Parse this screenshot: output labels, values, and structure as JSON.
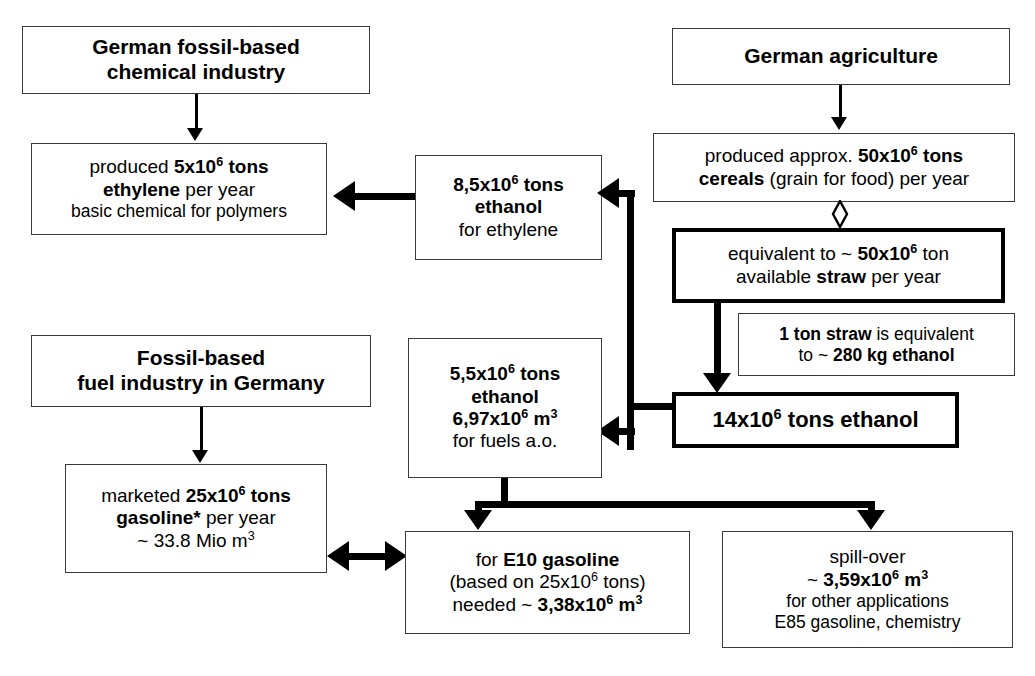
{
  "diagram": {
    "colors": {
      "line": "#000000",
      "box_border": "#3a3a3a",
      "background": "#ffffff"
    }
  },
  "boxes": {
    "chemical_industry": {
      "lines": [
        "German fossil-based",
        "chemical industry"
      ]
    },
    "ethylene": {
      "line1_pre": "produced ",
      "line1_b": "5x10",
      "line1_sup": "6",
      "line1_b2": " tons",
      "line2_b": "ethylene",
      "line2_post": " per year",
      "line3": "basic chemical for polymers"
    },
    "ethanol_ethylene": {
      "line1_b": "8,5x10",
      "line1_sup": "6",
      "line1_b2": " tons",
      "line2_b": "ethanol",
      "line3": "for ethylene"
    },
    "agriculture": {
      "line1": "German agriculture"
    },
    "cereals": {
      "line1_pre": "produced approx. ",
      "line1_b": "50x10",
      "line1_sup": "6",
      "line1_b2": " tons",
      "line2_b": "cereals",
      "line2_post": " (grain for food) per year"
    },
    "straw": {
      "line1_pre": "equivalent to ~ ",
      "line1_b": "50x10",
      "line1_sup": "6",
      "line1_post": " ton",
      "line2_pre": "available ",
      "line2_b": "straw",
      "line2_post": " per year"
    },
    "straw_conversion": {
      "line1_b": "1 ton straw",
      "line1_post": " is equivalent",
      "line2_pre": "to ~ ",
      "line2_b": "280 kg ethanol"
    },
    "ethanol_total": {
      "line1_b": "14x10",
      "line1_sup": "6",
      "line1_b2": " tons ethanol"
    },
    "fuel_industry": {
      "lines": [
        "Fossil-based",
        "fuel industry in Germany"
      ]
    },
    "gasoline": {
      "line1_pre": "marketed ",
      "line1_b": "25x10",
      "line1_sup": "6",
      "line1_b2": " tons",
      "line2_b": "gasoline*",
      "line2_post": " per year",
      "line3_pre": "~ 33.8 Mio m",
      "line3_sup": "3"
    },
    "ethanol_fuels": {
      "line1_b": "5,5x10",
      "line1_sup": "6",
      "line1_b2": " tons",
      "line2_b": "ethanol",
      "line3_b": "6,97x10",
      "line3_sup": "6",
      "line3_b2": " m",
      "line3_sup2": "3",
      "line4": "for fuels a.o."
    },
    "e10": {
      "line1_pre": "for ",
      "line1_b": "E10 gasoline",
      "line2_pre": "(based on 25x10",
      "line2_sup": "6",
      "line2_post": " tons)",
      "line3_pre": "needed ~ ",
      "line3_b": "3,38x10",
      "line3_sup": "6",
      "line3_b2": " m",
      "line3_sup2": "3"
    },
    "spillover": {
      "line1": "spill-over",
      "line2_pre": "~ ",
      "line2_b": "3,59x10",
      "line2_sup": "6",
      "line2_b2": " m",
      "line2_sup2": "3",
      "line3": "for other applications",
      "line4": "E85 gasoline, chemistry"
    }
  },
  "connectors": {
    "chemical_to_ethylene": "arrow-down",
    "ethanol_to_ethylene": "arrow-left",
    "agriculture_to_cereals": "arrow-down",
    "cereals_to_straw": "double-headed-diamond",
    "straw_to_ethanol_total": "arrow-down",
    "ethanol_total_to_ethanol_ethylene": "bus-up-left-arrow",
    "ethanol_total_to_ethanol_fuels": "bus-left-arrow",
    "fuel_industry_to_gasoline": "arrow-down",
    "gasoline_to_e10": "double-headed-horizontal",
    "ethanol_fuels_to_e10": "bus-down-arrow",
    "ethanol_fuels_to_spillover": "bus-down-arrow"
  }
}
